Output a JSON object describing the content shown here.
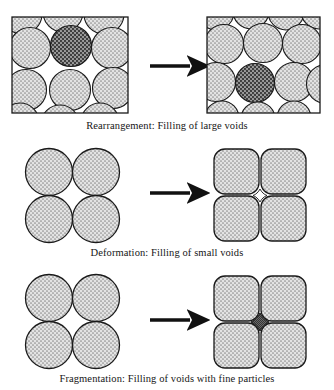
{
  "figure": {
    "background_color": "#ffffff",
    "line_color": "#1a1a1a",
    "particle_fill_color": "#d8d8d8",
    "particle_dark_fill_color": "#6e6e6e",
    "void_fill_color": "#5a5a5a"
  },
  "rows": [
    {
      "id": "rearrangement",
      "caption": "Rearrangement: Filling of large voids",
      "arrow": {
        "name": "right-arrow",
        "direction": "right"
      },
      "before": {
        "label": "loose packing with large voids",
        "container": "rectangular box",
        "particle_count": 12,
        "highlighted_particle": {
          "position": "top row, second from left",
          "fill": "dark"
        }
      },
      "after": {
        "label": "dense packing, large voids filled",
        "container": "rectangular box",
        "particle_count": 13,
        "highlighted_particle": {
          "position": "middle row, center",
          "fill": "dark"
        }
      }
    },
    {
      "id": "deformation",
      "caption": "Deformation: Filling of small voids",
      "arrow": {
        "name": "right-arrow",
        "direction": "right"
      },
      "before": {
        "label": "four spherical particles with interstitial voids",
        "container": "none",
        "particle_count": 4,
        "particle_shape": "circle"
      },
      "after": {
        "label": "four deformed particles, small voids reduced",
        "container": "none",
        "particle_count": 4,
        "particle_shape": "rounded-square",
        "center_void": {
          "shape": "concave-diamond",
          "filled": false
        }
      }
    },
    {
      "id": "fragmentation",
      "caption": "Fragmentation: Filling of voids with fine particles",
      "arrow": {
        "name": "right-arrow",
        "direction": "right"
      },
      "before": {
        "label": "four spherical particles with interstitial voids",
        "container": "none",
        "particle_count": 4,
        "particle_shape": "circle"
      },
      "after": {
        "label": "four deformed particles with fine particles in the void",
        "container": "none",
        "particle_count": 4,
        "particle_shape": "rounded-square",
        "center_void": {
          "shape": "concave-diamond",
          "filled": true,
          "contents": "fine particles"
        }
      }
    }
  ]
}
